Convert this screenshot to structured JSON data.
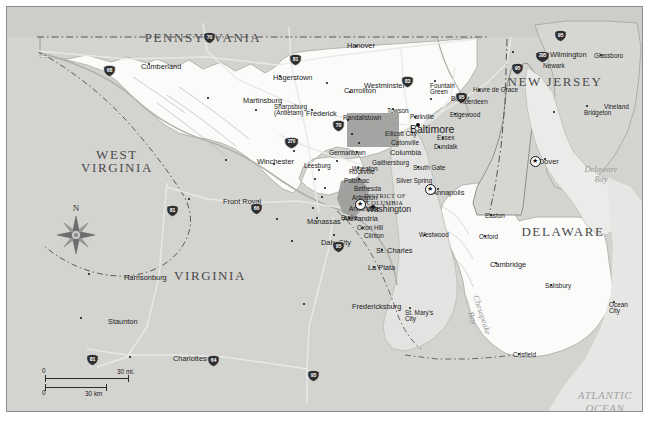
{
  "map": {
    "title": "Maryland and surrounding states reference map",
    "background_color": "#d3d3d0",
    "land_color": "#d3d3d0",
    "highlight_color": "#fbfbfa",
    "water_color": "#ebebe9",
    "urban_color": "#9a9a98",
    "frame_color": "#8d8d8d"
  },
  "states": [
    {
      "name": "PENNSYLVANIA",
      "x": 196,
      "y": 24,
      "size": "big"
    },
    {
      "name": "NEW JERSEY",
      "x": 548,
      "y": 68,
      "size": "big"
    },
    {
      "name": "WEST\nVIRGINIA",
      "x": 110,
      "y": 141,
      "size": "big"
    },
    {
      "name": "DELAWARE",
      "x": 556,
      "y": 218,
      "size": "big"
    },
    {
      "name": "VIRGINIA",
      "x": 203,
      "y": 262,
      "size": "big"
    }
  ],
  "water_labels": [
    {
      "name": "Delaware\nBay",
      "x": 594,
      "y": 158
    },
    {
      "name": "Chesapeake\nBay",
      "x": 470,
      "y": 300
    },
    {
      "name": "ATLANTIC\nOCEAN",
      "x": 598,
      "y": 382
    }
  ],
  "district": {
    "label": "DISTRICT OF\nCOLUMBIA",
    "x": 378,
    "y": 185
  },
  "cities": [
    {
      "name": "Hanover",
      "x": 349,
      "y": 39,
      "mx": 340,
      "my": 39,
      "size": "med"
    },
    {
      "name": "Cumberland",
      "x": 142,
      "y": 57,
      "mx": 134,
      "my": 60,
      "size": "med"
    },
    {
      "name": "Hagerstown",
      "x": 273,
      "y": 69,
      "mx": 266,
      "my": 71,
      "size": "med"
    },
    {
      "name": "Westminster",
      "x": 320,
      "y": 76,
      "mx": 357,
      "my": 79,
      "size": "med"
    },
    {
      "name": "Carrollton",
      "x": 343,
      "y": 85,
      "mx": 337,
      "my": 84,
      "size": "med"
    },
    {
      "name": "Fountain\nGreen",
      "x": 428,
      "y": 74,
      "mx": 423,
      "my": 80,
      "size": "small"
    },
    {
      "name": "Havre de Grace",
      "x": 472,
      "y": 83,
      "mx": 466,
      "my": 84,
      "size": "small"
    },
    {
      "name": "Wilmington",
      "x": 506,
      "y": 45,
      "mx": 543,
      "my": 48,
      "size": "med"
    },
    {
      "name": "Glassboro",
      "x": 594,
      "y": 48,
      "mx": 587,
      "my": 50,
      "size": "small"
    },
    {
      "name": "Newark",
      "x": 511,
      "y": 58,
      "mx": 536,
      "my": 60,
      "size": "small"
    },
    {
      "name": "Martinsburg",
      "x": 201,
      "y": 91,
      "mx": 236,
      "my": 94,
      "size": "med"
    },
    {
      "name": "Frederick",
      "x": 305,
      "y": 103,
      "mx": 299,
      "my": 107,
      "size": "med"
    },
    {
      "name": "Sharpsburg\n(Antietam)",
      "x": 249,
      "y": 103,
      "mx": 267,
      "my": 101,
      "size": "small"
    },
    {
      "name": "Randallstown",
      "x": 341,
      "y": 113,
      "mx": 336,
      "my": 112,
      "size": "small"
    },
    {
      "name": "Towson",
      "x": 386,
      "y": 102,
      "mx": 380,
      "my": 105,
      "size": "small"
    },
    {
      "name": "Parkville",
      "x": 408,
      "y": 110,
      "mx": 403,
      "my": 111,
      "size": "small"
    },
    {
      "name": "Bel Air",
      "x": 424,
      "y": 92,
      "mx": 444,
      "my": 93,
      "size": "small"
    },
    {
      "name": "Aberdeen",
      "x": 458,
      "y": 94,
      "mx": 453,
      "my": 96,
      "size": "small"
    },
    {
      "name": "Edgewood",
      "x": 448,
      "y": 107,
      "mx": 443,
      "my": 109,
      "size": "small"
    },
    {
      "name": "Vineland",
      "x": 580,
      "y": 99,
      "mx": 597,
      "my": 101,
      "size": "small"
    },
    {
      "name": "Bridgeton",
      "x": 547,
      "y": 105,
      "mx": 577,
      "my": 107,
      "size": "small"
    },
    {
      "name": "Baltimore",
      "x": 410,
      "y": 117,
      "mx": 403,
      "my": 121,
      "size": "major"
    },
    {
      "name": "Ellicott City",
      "x": 345,
      "y": 127,
      "mx": 378,
      "my": 128,
      "size": "small"
    },
    {
      "name": "Essex",
      "x": 436,
      "y": 131,
      "mx": 430,
      "my": 132,
      "size": "small"
    },
    {
      "name": "Catonville",
      "x": 352,
      "y": 136,
      "mx": 384,
      "my": 137,
      "size": "small"
    },
    {
      "name": "Dundalk",
      "x": 432,
      "y": 140,
      "mx": 427,
      "my": 141,
      "size": "small"
    },
    {
      "name": "Columbia",
      "x": 350,
      "y": 145,
      "mx": 383,
      "my": 146,
      "size": "med"
    },
    {
      "name": "Germantown",
      "x": 287,
      "y": 144,
      "mx": 322,
      "my": 147,
      "size": "small"
    },
    {
      "name": "Winchester",
      "x": 219,
      "y": 153,
      "mx": 250,
      "my": 155,
      "size": "med"
    },
    {
      "name": "Leesburg",
      "x": 267,
      "y": 157,
      "mx": 297,
      "my": 160,
      "size": "small"
    },
    {
      "name": "Gaithersburg",
      "x": 330,
      "y": 154,
      "mx": 365,
      "my": 157,
      "size": "small"
    },
    {
      "name": "Wheaton",
      "x": 351,
      "y": 161,
      "mx": 345,
      "my": 163,
      "size": "small"
    },
    {
      "name": "South Gate",
      "x": 411,
      "y": 160,
      "mx": 406,
      "my": 162,
      "size": "small"
    },
    {
      "name": "Rockville",
      "x": 312,
      "y": 163,
      "mx": 342,
      "my": 166,
      "size": "small"
    },
    {
      "name": "Potomac",
      "x": 308,
      "y": 172,
      "mx": 337,
      "my": 175,
      "size": "small"
    },
    {
      "name": "Silver Spring",
      "x": 352,
      "y": 172,
      "mx": 389,
      "my": 175,
      "size": "small"
    },
    {
      "name": "Annapolis",
      "x": 431,
      "y": 182,
      "mx": 425,
      "my": 186,
      "size": "med"
    },
    {
      "name": "Bethesda",
      "x": 318,
      "y": 181,
      "mx": 347,
      "my": 183,
      "size": "small"
    },
    {
      "name": "Arlington",
      "x": 315,
      "y": 190,
      "mx": 345,
      "my": 192,
      "size": "small"
    },
    {
      "name": "Front Royal",
      "x": 182,
      "y": 192,
      "mx": 216,
      "my": 195,
      "size": "med"
    },
    {
      "name": "Washington",
      "x": 365,
      "y": 199,
      "mx": 359,
      "my": 202,
      "size": "cap"
    },
    {
      "name": "Annandale",
      "x": 306,
      "y": 201,
      "mx": 342,
      "my": 203,
      "size": "small"
    },
    {
      "name": "Alexandria",
      "x": 342,
      "y": 211,
      "mx": 336,
      "my": 212,
      "size": "med"
    },
    {
      "name": "Burke",
      "x": 310,
      "y": 211,
      "mx": 334,
      "my": 212,
      "size": "small"
    },
    {
      "name": "Manassas",
      "x": 270,
      "y": 212,
      "mx": 300,
      "my": 215,
      "size": "med"
    },
    {
      "name": "Oxon Hill",
      "x": 355,
      "y": 221,
      "mx": 350,
      "my": 222,
      "size": "small"
    },
    {
      "name": "Westwood",
      "x": 418,
      "y": 228,
      "mx": 412,
      "my": 229,
      "size": "small"
    },
    {
      "name": "Easton",
      "x": 484,
      "y": 208,
      "mx": 478,
      "my": 210,
      "size": "small"
    },
    {
      "name": "Clinton",
      "x": 327,
      "y": 228,
      "mx": 357,
      "my": 230,
      "size": "small"
    },
    {
      "name": "Dale City",
      "x": 285,
      "y": 234,
      "mx": 314,
      "my": 236,
      "size": "med"
    },
    {
      "name": "Oxford",
      "x": 478,
      "y": 229,
      "mx": 472,
      "my": 231,
      "size": "small"
    },
    {
      "name": "St. Charles",
      "x": 375,
      "y": 243,
      "mx": 369,
      "my": 244,
      "size": "med"
    },
    {
      "name": "Cambridge",
      "x": 489,
      "y": 256,
      "mx": 483,
      "my": 258,
      "size": "med"
    },
    {
      "name": "La Plata",
      "x": 367,
      "y": 260,
      "mx": 361,
      "my": 261,
      "size": "med"
    },
    {
      "name": "Salisbury",
      "x": 544,
      "y": 278,
      "mx": 538,
      "my": 280,
      "size": "small"
    },
    {
      "name": "Harrisonburg",
      "x": 82,
      "y": 267,
      "mx": 117,
      "my": 271,
      "size": "med"
    },
    {
      "name": "Ocean\nCity",
      "x": 607,
      "y": 295,
      "mx": 602,
      "my": 299,
      "size": "small"
    },
    {
      "name": "Fredericksburg",
      "x": 297,
      "y": 297,
      "mx": 345,
      "my": 300,
      "size": "med"
    },
    {
      "name": "St. Mary's\nCity",
      "x": 403,
      "y": 301,
      "mx": 398,
      "my": 307,
      "size": "small"
    },
    {
      "name": "Staunton",
      "x": 74,
      "y": 311,
      "mx": 101,
      "my": 315,
      "size": "med"
    },
    {
      "name": "Crisfield",
      "x": 512,
      "y": 347,
      "mx": 506,
      "my": 349,
      "size": "small"
    },
    {
      "name": "Charlottesville",
      "x": 123,
      "y": 350,
      "mx": 166,
      "my": 352,
      "size": "med"
    },
    {
      "name": "Dover",
      "x": 538,
      "y": 152,
      "mx": 532,
      "my": 155,
      "size": "med"
    }
  ],
  "capitals": [
    {
      "name": "Washington",
      "x": 352,
      "y": 196
    },
    {
      "name": "Annapolis",
      "x": 422,
      "y": 181
    },
    {
      "name": "Dover",
      "x": 527,
      "y": 153
    }
  ],
  "interstates": [
    {
      "number": "70",
      "x": 196,
      "y": 25
    },
    {
      "number": "81",
      "x": 282,
      "y": 47
    },
    {
      "number": "68",
      "x": 96,
      "y": 58
    },
    {
      "number": "95",
      "x": 547,
      "y": 23
    },
    {
      "number": "295",
      "x": 528,
      "y": 44,
      "wide": true
    },
    {
      "number": "95",
      "x": 504,
      "y": 56
    },
    {
      "number": "83",
      "x": 394,
      "y": 69
    },
    {
      "number": "95",
      "x": 448,
      "y": 85
    },
    {
      "number": "70",
      "x": 325,
      "y": 113
    },
    {
      "number": "270",
      "x": 277,
      "y": 130,
      "wide": true
    },
    {
      "number": "81",
      "x": 159,
      "y": 198
    },
    {
      "number": "66",
      "x": 243,
      "y": 196
    },
    {
      "number": "95",
      "x": 325,
      "y": 234
    },
    {
      "number": "81",
      "x": 79,
      "y": 347
    },
    {
      "number": "64",
      "x": 200,
      "y": 348
    },
    {
      "number": "95",
      "x": 300,
      "y": 363
    }
  ],
  "compass": {
    "label": "N"
  },
  "scale": {
    "miles_zero": "0",
    "miles_max": "30 mi.",
    "km_zero": "0",
    "km_max": "30 km"
  }
}
